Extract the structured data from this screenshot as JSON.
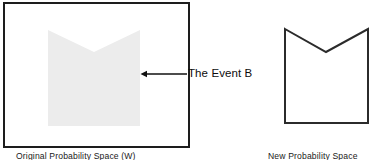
{
  "figure": {
    "width": 387,
    "height": 160,
    "background_color": "#ffffff"
  },
  "colors": {
    "outline": "#1d1d1d",
    "event_fill": "#ececec",
    "event_outline_right": "#2b2b2b",
    "text": "#0d0d0d",
    "arrow": "#111111"
  },
  "left_panel": {
    "name": "original-probability-space",
    "caption": "Original Probability Space (W)",
    "rectangle": {
      "x": 3,
      "y": 2,
      "width": 187,
      "height": 146,
      "stroke": "#1d1d1d",
      "stroke_width": 2,
      "fill": "#ffffff"
    },
    "event_shape": {
      "name": "event-b-region",
      "fill": "#ececec",
      "stroke": "none",
      "points": "48,30 94,52 140,30 140,126 48,126"
    }
  },
  "annotation": {
    "label": "The Event B",
    "arrow": {
      "name": "pointer-arrow",
      "direction": "left",
      "from_x": 187,
      "to_x": 141,
      "y": 74,
      "color": "#111111",
      "stroke_width": 1.4
    }
  },
  "right_panel": {
    "name": "new-probability-space",
    "caption": "New Probability Space",
    "event_shape": {
      "name": "event-b-as-new-space",
      "fill": "none",
      "stroke": "#2b2b2b",
      "stroke_width": 2,
      "points": "285,29 326,52 368,29 368,123 285,123"
    }
  }
}
